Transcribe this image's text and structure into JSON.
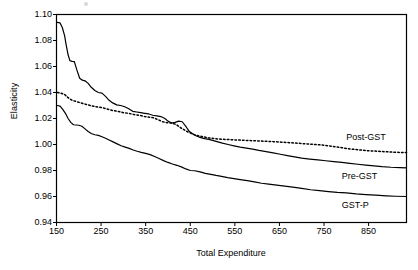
{
  "chart_data": {
    "type": "line",
    "title": "",
    "xlabel": "Total Expenditure",
    "ylabel": "Elasticity",
    "xlim": [
      150,
      935
    ],
    "ylim": [
      0.94,
      1.1
    ],
    "xticks": [
      150,
      250,
      350,
      450,
      550,
      650,
      750,
      850
    ],
    "yticks": [
      0.94,
      0.96,
      0.98,
      1.0,
      1.02,
      1.04,
      1.06,
      1.08,
      1.1
    ],
    "ytick_labels": [
      "0.94",
      "0.96",
      "0.98",
      "1.00",
      "1.02",
      "1.04",
      "1.06",
      "1.08",
      "1.10"
    ],
    "xtick_labels": [
      "150",
      "250",
      "350",
      "450",
      "550",
      "650",
      "750",
      "850"
    ],
    "grid": false,
    "legend_position": "inline-right-annotations",
    "series": [
      {
        "name": "Pre-GST",
        "style": "solid",
        "color": "#000000",
        "label_x": 790,
        "label_y": 0.9755,
        "x": [
          152,
          158,
          163,
          168,
          172,
          176,
          180,
          185,
          190,
          196,
          202,
          208,
          214,
          221,
          228,
          236,
          244,
          252,
          260,
          268,
          276,
          285,
          294,
          303,
          312,
          321,
          330,
          339,
          348,
          357,
          366,
          375,
          384,
          393,
          400,
          408,
          416,
          424,
          432,
          440,
          448,
          456,
          464,
          472,
          482,
          492,
          502,
          512,
          522,
          535,
          548,
          562,
          576,
          590,
          604,
          620,
          636,
          652,
          668,
          684,
          700,
          718,
          736,
          754,
          772,
          790,
          808,
          826,
          844,
          862,
          880,
          900,
          920,
          935
        ],
        "y": [
          1.094,
          1.0935,
          1.09,
          1.084,
          1.076,
          1.069,
          1.0645,
          1.064,
          1.0638,
          1.057,
          1.051,
          1.0495,
          1.049,
          1.047,
          1.044,
          1.0415,
          1.04,
          1.0395,
          1.037,
          1.034,
          1.032,
          1.0305,
          1.03,
          1.029,
          1.0275,
          1.0255,
          1.025,
          1.0245,
          1.024,
          1.0235,
          1.0225,
          1.022,
          1.0215,
          1.02,
          1.018,
          1.0165,
          1.017,
          1.018,
          1.0175,
          1.014,
          1.01,
          1.008,
          1.0065,
          1.0055,
          1.0045,
          1.004,
          1.003,
          1.002,
          1.001,
          1.0,
          0.999,
          0.998,
          0.9972,
          0.9965,
          0.9955,
          0.9945,
          0.9935,
          0.9925,
          0.9915,
          0.9905,
          0.9895,
          0.9888,
          0.9882,
          0.9875,
          0.9868,
          0.9862,
          0.9855,
          0.9848,
          0.9842,
          0.9836,
          0.983,
          0.9825,
          0.9822,
          0.982
        ]
      },
      {
        "name": "Post-GST",
        "style": "dotted",
        "color": "#000000",
        "label_x": 800,
        "label_y": 1.0055,
        "x": [
          152,
          160,
          168,
          176,
          185,
          195,
          205,
          215,
          226,
          238,
          250,
          262,
          275,
          288,
          300,
          312,
          324,
          336,
          348,
          358,
          368,
          378,
          388,
          398,
          408,
          418,
          428,
          440,
          452,
          464,
          478,
          492,
          506,
          520,
          536,
          552,
          568,
          584,
          600,
          618,
          636,
          654,
          672,
          690,
          710,
          730,
          750,
          770,
          790,
          810,
          830,
          850,
          870,
          890,
          910,
          935
        ],
        "y": [
          1.04,
          1.0395,
          1.0385,
          1.036,
          1.034,
          1.033,
          1.032,
          1.031,
          1.03,
          1.029,
          1.0285,
          1.0275,
          1.0262,
          1.0255,
          1.0245,
          1.024,
          1.023,
          1.0225,
          1.0215,
          1.021,
          1.0205,
          1.019,
          1.0175,
          1.0168,
          1.0165,
          1.0155,
          1.013,
          1.0105,
          1.0085,
          1.007,
          1.006,
          1.005,
          1.0045,
          1.004,
          1.0038,
          1.0035,
          1.0033,
          1.003,
          1.0028,
          1.0025,
          1.0022,
          1.0018,
          1.0014,
          1.001,
          1.0005,
          1.0,
          0.9995,
          0.9985,
          0.9975,
          0.9965,
          0.9958,
          0.9952,
          0.9948,
          0.9944,
          0.994,
          0.9938
        ]
      },
      {
        "name": "GST-P",
        "style": "solid",
        "color": "#000000",
        "label_x": 790,
        "label_y": 0.9535,
        "x": [
          152,
          158,
          164,
          170,
          176,
          182,
          188,
          194,
          200,
          207,
          214,
          221,
          228,
          236,
          244,
          252,
          260,
          268,
          277,
          286,
          295,
          304,
          313,
          322,
          331,
          340,
          350,
          360,
          370,
          380,
          390,
          400,
          410,
          420,
          430,
          440,
          450,
          460,
          472,
          484,
          496,
          508,
          520,
          534,
          548,
          562,
          578,
          594,
          610,
          626,
          644,
          662,
          680,
          700,
          720,
          740,
          760,
          780,
          800,
          822,
          844,
          866,
          890,
          910,
          935
        ],
        "y": [
          1.03,
          1.0295,
          1.027,
          1.024,
          1.02,
          1.017,
          1.0152,
          1.015,
          1.0148,
          1.014,
          1.012,
          1.01,
          1.0085,
          1.0075,
          1.007,
          1.006,
          1.0048,
          1.0035,
          1.002,
          1.0005,
          0.999,
          0.998,
          0.997,
          0.9958,
          0.9948,
          0.994,
          0.9932,
          0.9922,
          0.9908,
          0.9892,
          0.9876,
          0.9862,
          0.985,
          0.984,
          0.9828,
          0.9812,
          0.98,
          0.9798,
          0.979,
          0.9778,
          0.977,
          0.9762,
          0.9755,
          0.9745,
          0.9738,
          0.973,
          0.9722,
          0.9712,
          0.9702,
          0.9695,
          0.9688,
          0.968,
          0.9672,
          0.9662,
          0.9652,
          0.9645,
          0.9638,
          0.9632,
          0.9628,
          0.962,
          0.9615,
          0.961,
          0.9605,
          0.9602,
          0.96
        ]
      }
    ]
  }
}
